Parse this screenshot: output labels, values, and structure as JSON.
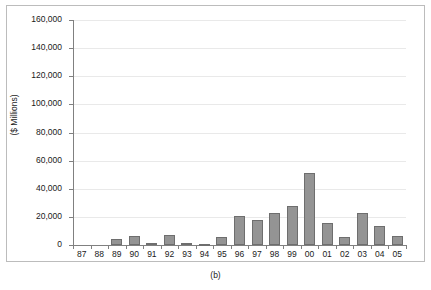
{
  "figure": {
    "caption": "(b)"
  },
  "chart_data": {
    "type": "bar",
    "title": "",
    "subtitle": "",
    "xlabel": "",
    "ylabel": "($ Millions)",
    "grid": true,
    "legend": "none",
    "ylim": [
      0,
      160000
    ],
    "ytick_labels": [
      "160,000",
      "140,000",
      "120,000",
      "100,000",
      "80,000",
      "60,000",
      "40,000",
      "20,000",
      "0"
    ],
    "ytick_values": [
      160000,
      140000,
      120000,
      100000,
      80000,
      60000,
      40000,
      20000,
      0
    ],
    "categories": [
      "87",
      "88",
      "89",
      "90",
      "91",
      "92",
      "93",
      "94",
      "95",
      "96",
      "97",
      "98",
      "99",
      "00",
      "01",
      "02",
      "03",
      "04",
      "05"
    ],
    "values": [
      0,
      0,
      4500,
      6200,
      1300,
      7000,
      1600,
      200,
      5600,
      20500,
      18000,
      22500,
      27500,
      51500,
      15500,
      6000,
      23000,
      13500,
      6500
    ],
    "series": [
      {
        "name": "",
        "values": [
          0,
          0,
          4500,
          6200,
          1300,
          7000,
          1600,
          200,
          5600,
          20500,
          18000,
          22500,
          27500,
          51500,
          15500,
          6000,
          23000,
          13500,
          6500
        ]
      }
    ],
    "colors": {
      "bar_fill": "#949494",
      "bar_border": "#6e6e6e",
      "gridline": "#e9e9e9",
      "axis": "#808080",
      "text": "#1a1a1a",
      "background": "#ffffff"
    }
  }
}
